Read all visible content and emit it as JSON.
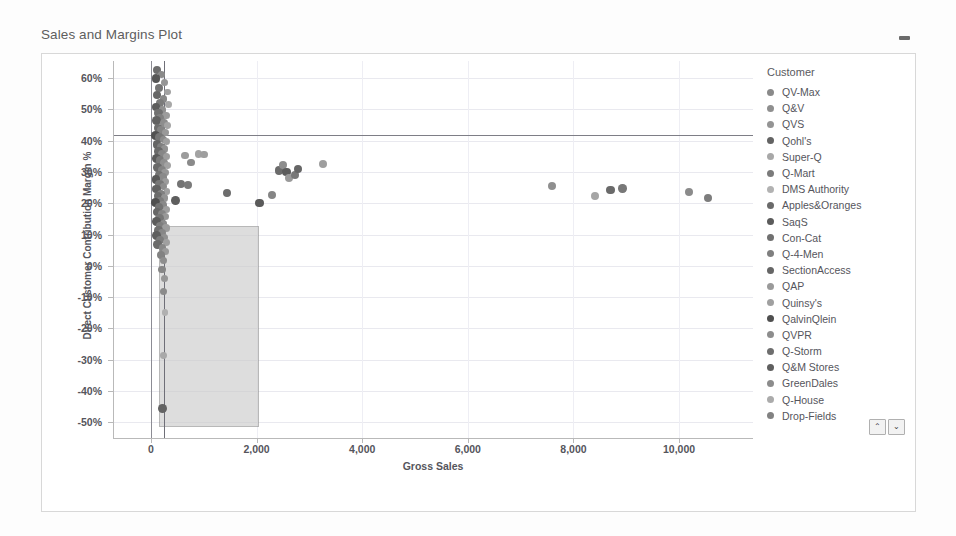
{
  "header": {
    "title": "Sales and Margins Plot",
    "minimize_icon": "minimize-icon"
  },
  "legend": {
    "title": "Customer",
    "scroll_up_label": "⌃",
    "scroll_down_label": "⌄",
    "items": [
      {
        "label": "QV-Max",
        "color": "#8a8a8a"
      },
      {
        "label": "Q&V",
        "color": "#8f8f8f"
      },
      {
        "label": "QVS",
        "color": "#949494"
      },
      {
        "label": "Qohl's",
        "color": "#636363"
      },
      {
        "label": "Super-Q",
        "color": "#a8a8a8"
      },
      {
        "label": "Q-Mart",
        "color": "#7b7b7b"
      },
      {
        "label": "DMS Authority",
        "color": "#b2b2b2"
      },
      {
        "label": "Apples&Oranges",
        "color": "#6a6a6a"
      },
      {
        "label": "SaqS",
        "color": "#5b5b5b"
      },
      {
        "label": "Con-Cat",
        "color": "#707070"
      },
      {
        "label": "Q-4-Men",
        "color": "#7f7f7f"
      },
      {
        "label": "SectionAccess",
        "color": "#666666"
      },
      {
        "label": "QAP",
        "color": "#9a9a9a"
      },
      {
        "label": "Quinsy's",
        "color": "#a0a0a0"
      },
      {
        "label": "QalvinQlein",
        "color": "#4f4f4f"
      },
      {
        "label": "QVPR",
        "color": "#8d8d8d"
      },
      {
        "label": "Q-Storm",
        "color": "#6e6e6e"
      },
      {
        "label": "Q&M Stores",
        "color": "#5f5f5f"
      },
      {
        "label": "GreenDales",
        "color": "#8c8c8c"
      },
      {
        "label": "Q-House",
        "color": "#ababab"
      },
      {
        "label": "Drop-Fields",
        "color": "#828282"
      }
    ]
  },
  "chart_data": {
    "type": "scatter",
    "title": "Sales and Margins Plot",
    "xlabel": "Gross Sales",
    "ylabel": "Direct Customer Contribution Margin %",
    "xlim": [
      -700,
      11400
    ],
    "ylim": [
      -0.55,
      0.655
    ],
    "grid": true,
    "legend_position": "right",
    "xticks": [
      0,
      2000,
      4000,
      6000,
      8000,
      10000
    ],
    "xticklabels": [
      "0",
      "2,000",
      "4,000",
      "6,000",
      "8,000",
      "10,000"
    ],
    "yticks": [
      0.6,
      0.5,
      0.4,
      0.3,
      0.2,
      0.1,
      0.0,
      -0.1,
      -0.2,
      -0.3,
      -0.4,
      -0.5
    ],
    "yticklabels": [
      "60%",
      "50%",
      "40%",
      "30%",
      "20%",
      "10%",
      "0%",
      "-10%",
      "-20%",
      "-30%",
      "-40%",
      "-50%"
    ],
    "reference_lines": [
      {
        "orientation": "horizontal",
        "value": 0.418,
        "color": "#7e7e86",
        "label": "average margin"
      },
      {
        "orientation": "vertical",
        "value": 0,
        "color": "#8c8c94",
        "label": "zero sales"
      },
      {
        "orientation": "vertical",
        "value": 250,
        "color": "#6f6f78",
        "label": "average sales"
      }
    ],
    "reference_band": {
      "x_from": 150,
      "x_to": 2050,
      "y_from": -0.515,
      "y_to": 0.128,
      "fill": "#c9c9c9",
      "border": "#8e8e8e",
      "opacity": 0.62,
      "label": "low margin region"
    },
    "points": [
      {
        "x": 120,
        "y": 0.625,
        "c": "#6d6d6d",
        "r": 4.0
      },
      {
        "x": 205,
        "y": 0.612,
        "c": "#8a8a8a",
        "r": 3.6
      },
      {
        "x": 95,
        "y": 0.598,
        "c": "#565656",
        "r": 4.4
      },
      {
        "x": 260,
        "y": 0.586,
        "c": "#959595",
        "r": 3.6
      },
      {
        "x": 160,
        "y": 0.57,
        "c": "#747474",
        "r": 4.0
      },
      {
        "x": 315,
        "y": 0.556,
        "c": "#a2a2a2",
        "r": 3.4
      },
      {
        "x": 110,
        "y": 0.546,
        "c": "#666666",
        "r": 4.2
      },
      {
        "x": 240,
        "y": 0.534,
        "c": "#888888",
        "r": 3.8
      },
      {
        "x": 180,
        "y": 0.522,
        "c": "#7b7b7b",
        "r": 4.0
      },
      {
        "x": 330,
        "y": 0.515,
        "c": "#a8a8a8",
        "r": 3.6
      },
      {
        "x": 90,
        "y": 0.508,
        "c": "#5d5d5d",
        "r": 4.2
      },
      {
        "x": 215,
        "y": 0.498,
        "c": "#909090",
        "r": 3.8
      },
      {
        "x": 140,
        "y": 0.489,
        "c": "#717171",
        "r": 4.2
      },
      {
        "x": 285,
        "y": 0.481,
        "c": "#9c9c9c",
        "r": 3.6
      },
      {
        "x": 175,
        "y": 0.472,
        "c": "#808080",
        "r": 4.0
      },
      {
        "x": 105,
        "y": 0.464,
        "c": "#616161",
        "r": 4.4
      },
      {
        "x": 250,
        "y": 0.457,
        "c": "#8d8d8d",
        "r": 3.8
      },
      {
        "x": 320,
        "y": 0.449,
        "c": "#a5a5a5",
        "r": 3.4
      },
      {
        "x": 130,
        "y": 0.441,
        "c": "#6e6e6e",
        "r": 4.2
      },
      {
        "x": 195,
        "y": 0.433,
        "c": "#848484",
        "r": 4.0
      },
      {
        "x": 270,
        "y": 0.426,
        "c": "#999999",
        "r": 3.6
      },
      {
        "x": 85,
        "y": 0.418,
        "c": "#525252",
        "r": 4.6
      },
      {
        "x": 160,
        "y": 0.411,
        "c": "#777777",
        "r": 4.2
      },
      {
        "x": 235,
        "y": 0.404,
        "c": "#8b8b8b",
        "r": 3.8
      },
      {
        "x": 300,
        "y": 0.397,
        "c": "#a0a0a0",
        "r": 3.6
      },
      {
        "x": 115,
        "y": 0.389,
        "c": "#656565",
        "r": 4.4
      },
      {
        "x": 185,
        "y": 0.381,
        "c": "#7f7f7f",
        "r": 4.0
      },
      {
        "x": 255,
        "y": 0.374,
        "c": "#929292",
        "r": 3.8
      },
      {
        "x": 145,
        "y": 0.366,
        "c": "#6a6a6a",
        "r": 4.2
      },
      {
        "x": 210,
        "y": 0.358,
        "c": "#868686",
        "r": 4.0
      },
      {
        "x": 290,
        "y": 0.351,
        "c": "#9e9e9e",
        "r": 3.6
      },
      {
        "x": 100,
        "y": 0.344,
        "c": "#5a5a5a",
        "r": 4.4
      },
      {
        "x": 170,
        "y": 0.337,
        "c": "#7a7a7a",
        "r": 4.2
      },
      {
        "x": 245,
        "y": 0.329,
        "c": "#8f8f8f",
        "r": 3.8
      },
      {
        "x": 310,
        "y": 0.322,
        "c": "#a3a3a3",
        "r": 3.4
      },
      {
        "x": 125,
        "y": 0.314,
        "c": "#696969",
        "r": 4.2
      },
      {
        "x": 200,
        "y": 0.307,
        "c": "#838383",
        "r": 4.0
      },
      {
        "x": 265,
        "y": 0.299,
        "c": "#979797",
        "r": 3.8
      },
      {
        "x": 155,
        "y": 0.291,
        "c": "#747474",
        "r": 4.2
      },
      {
        "x": 225,
        "y": 0.284,
        "c": "#8a8a8a",
        "r": 3.8
      },
      {
        "x": 95,
        "y": 0.276,
        "c": "#585858",
        "r": 4.4
      },
      {
        "x": 280,
        "y": 0.269,
        "c": "#9b9b9b",
        "r": 3.6
      },
      {
        "x": 165,
        "y": 0.261,
        "c": "#787878",
        "r": 4.2
      },
      {
        "x": 240,
        "y": 0.254,
        "c": "#8d8d8d",
        "r": 3.8
      },
      {
        "x": 110,
        "y": 0.246,
        "c": "#626262",
        "r": 4.4
      },
      {
        "x": 305,
        "y": 0.239,
        "c": "#a1a1a1",
        "r": 3.4
      },
      {
        "x": 190,
        "y": 0.231,
        "c": "#818181",
        "r": 4.0
      },
      {
        "x": 135,
        "y": 0.224,
        "c": "#6c6c6c",
        "r": 4.2
      },
      {
        "x": 260,
        "y": 0.217,
        "c": "#949494",
        "r": 3.8
      },
      {
        "x": 175,
        "y": 0.209,
        "c": "#7d7d7d",
        "r": 4.0
      },
      {
        "x": 85,
        "y": 0.202,
        "c": "#4f4f4f",
        "r": 4.6
      },
      {
        "x": 230,
        "y": 0.194,
        "c": "#898989",
        "r": 3.8
      },
      {
        "x": 150,
        "y": 0.187,
        "c": "#737373",
        "r": 4.2
      },
      {
        "x": 295,
        "y": 0.181,
        "c": "#9f9f9f",
        "r": 3.6
      },
      {
        "x": 120,
        "y": 0.173,
        "c": "#676767",
        "r": 4.2
      },
      {
        "x": 205,
        "y": 0.166,
        "c": "#858585",
        "r": 4.0
      },
      {
        "x": 270,
        "y": 0.158,
        "c": "#989898",
        "r": 3.6
      },
      {
        "x": 160,
        "y": 0.151,
        "c": "#767676",
        "r": 4.2
      },
      {
        "x": 100,
        "y": 0.143,
        "c": "#5c5c5c",
        "r": 4.4
      },
      {
        "x": 235,
        "y": 0.136,
        "c": "#8c8c8c",
        "r": 3.8
      },
      {
        "x": 180,
        "y": 0.128,
        "c": "#7e7e7e",
        "r": 4.0
      },
      {
        "x": 285,
        "y": 0.121,
        "c": "#9d9d9d",
        "r": 3.6
      },
      {
        "x": 140,
        "y": 0.113,
        "c": "#6f6f6f",
        "r": 4.2
      },
      {
        "x": 215,
        "y": 0.106,
        "c": "#878787",
        "r": 4.0
      },
      {
        "x": 105,
        "y": 0.098,
        "c": "#5f5f5f",
        "r": 4.4
      },
      {
        "x": 255,
        "y": 0.091,
        "c": "#919191",
        "r": 3.8
      },
      {
        "x": 170,
        "y": 0.083,
        "c": "#7c7c7c",
        "r": 4.0
      },
      {
        "x": 300,
        "y": 0.076,
        "c": "#a0a0a0",
        "r": 3.4
      },
      {
        "x": 125,
        "y": 0.068,
        "c": "#6b6b6b",
        "r": 4.2
      },
      {
        "x": 220,
        "y": 0.058,
        "c": "#888888",
        "r": 3.8
      },
      {
        "x": 275,
        "y": 0.046,
        "c": "#9a9a9a",
        "r": 3.6
      },
      {
        "x": 185,
        "y": 0.034,
        "c": "#828282",
        "r": 4.0
      },
      {
        "x": 245,
        "y": 0.018,
        "c": "#8e8e8e",
        "r": 3.6
      },
      {
        "x": 210,
        "y": -0.012,
        "c": "#868686",
        "r": 3.8
      },
      {
        "x": 260,
        "y": -0.041,
        "c": "#969696",
        "r": 3.6
      },
      {
        "x": 230,
        "y": -0.082,
        "c": "#8b8b8b",
        "r": 3.6
      },
      {
        "x": 265,
        "y": -0.148,
        "c": "#b0b0b0",
        "r": 3.4
      },
      {
        "x": 240,
        "y": -0.286,
        "c": "#a9a9a9",
        "r": 3.4
      },
      {
        "x": 215,
        "y": -0.455,
        "c": "#636363",
        "r": 4.4
      },
      {
        "x": 640,
        "y": 0.353,
        "c": "#9c9c9c",
        "r": 3.8
      },
      {
        "x": 760,
        "y": 0.33,
        "c": "#8a8a8a",
        "r": 3.8
      },
      {
        "x": 900,
        "y": 0.358,
        "c": "#a3a3a3",
        "r": 3.8
      },
      {
        "x": 1000,
        "y": 0.356,
        "c": "#9e9e9e",
        "r": 3.8
      },
      {
        "x": 560,
        "y": 0.262,
        "c": "#737373",
        "r": 4.0
      },
      {
        "x": 700,
        "y": 0.258,
        "c": "#7a7a7a",
        "r": 4.0
      },
      {
        "x": 470,
        "y": 0.209,
        "c": "#5e5e5e",
        "r": 4.4
      },
      {
        "x": 1440,
        "y": 0.233,
        "c": "#6d6d6d",
        "r": 4.2
      },
      {
        "x": 2050,
        "y": 0.201,
        "c": "#5a5a5a",
        "r": 4.4
      },
      {
        "x": 2290,
        "y": 0.228,
        "c": "#858585",
        "r": 4.0
      },
      {
        "x": 2420,
        "y": 0.305,
        "c": "#6b6b6b",
        "r": 4.2
      },
      {
        "x": 2500,
        "y": 0.322,
        "c": "#8d8d8d",
        "r": 4.0
      },
      {
        "x": 2560,
        "y": 0.3,
        "c": "#5c5c5c",
        "r": 4.4
      },
      {
        "x": 2620,
        "y": 0.282,
        "c": "#9a9a9a",
        "r": 4.0
      },
      {
        "x": 2720,
        "y": 0.29,
        "c": "#787878",
        "r": 4.0
      },
      {
        "x": 2780,
        "y": 0.31,
        "c": "#666666",
        "r": 4.2
      },
      {
        "x": 3260,
        "y": 0.326,
        "c": "#9e9e9e",
        "r": 4.0
      },
      {
        "x": 7600,
        "y": 0.256,
        "c": "#8f8f8f",
        "r": 4.0
      },
      {
        "x": 8400,
        "y": 0.222,
        "c": "#a5a5a5",
        "r": 4.0
      },
      {
        "x": 8700,
        "y": 0.243,
        "c": "#6a6a6a",
        "r": 4.2
      },
      {
        "x": 8930,
        "y": 0.247,
        "c": "#787878",
        "r": 4.2
      },
      {
        "x": 10180,
        "y": 0.237,
        "c": "#8b8b8b",
        "r": 4.0
      },
      {
        "x": 10540,
        "y": 0.216,
        "c": "#7d7d7d",
        "r": 4.0
      }
    ]
  }
}
